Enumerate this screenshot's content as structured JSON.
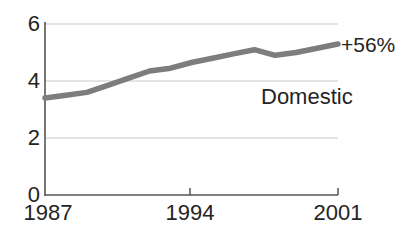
{
  "chart_data": {
    "type": "line",
    "title": "",
    "subtitle": "",
    "xlabel": "",
    "ylabel": "",
    "xlim": [
      1987,
      2001
    ],
    "ylim": [
      0,
      6
    ],
    "yticks": [
      "0",
      "2",
      "4",
      "6"
    ],
    "ytick_values": [
      0,
      2,
      4,
      6
    ],
    "xticks": [
      "1987",
      "1994",
      "2001"
    ],
    "xtick_values": [
      1987,
      1994,
      2001
    ],
    "grid": "horizontal",
    "legend_position": "inline-right",
    "series": [
      {
        "name": "Domestic",
        "color": "#7d7d7d",
        "x": [
          1987,
          1988,
          1989,
          1990,
          1991,
          1992,
          1993,
          1994,
          1995,
          1996,
          1997,
          1998,
          1999,
          2000,
          2001
        ],
        "values": [
          3.4,
          3.5,
          3.6,
          3.85,
          4.1,
          4.35,
          4.45,
          4.65,
          4.8,
          4.95,
          5.1,
          4.9,
          5.0,
          5.15,
          5.3
        ]
      }
    ],
    "annotations": [
      {
        "name": "series-label",
        "text": "Domestic",
        "x": 1998.2,
        "y": 3.2
      },
      {
        "name": "change-label",
        "text": "+56%",
        "x": 2001.4,
        "y": 5.35
      }
    ]
  },
  "labels": {
    "y_0": "0",
    "y_2": "2",
    "y_4": "4",
    "y_6": "6",
    "x_start": "1987",
    "x_mid": "1994",
    "x_end": "2001",
    "series_name": "Domestic",
    "change": "+56%"
  },
  "colors": {
    "line": "#7d7d7d",
    "axis": "#555555",
    "grid": "#c9c9c9",
    "text": "#242424",
    "background": "#ffffff"
  }
}
